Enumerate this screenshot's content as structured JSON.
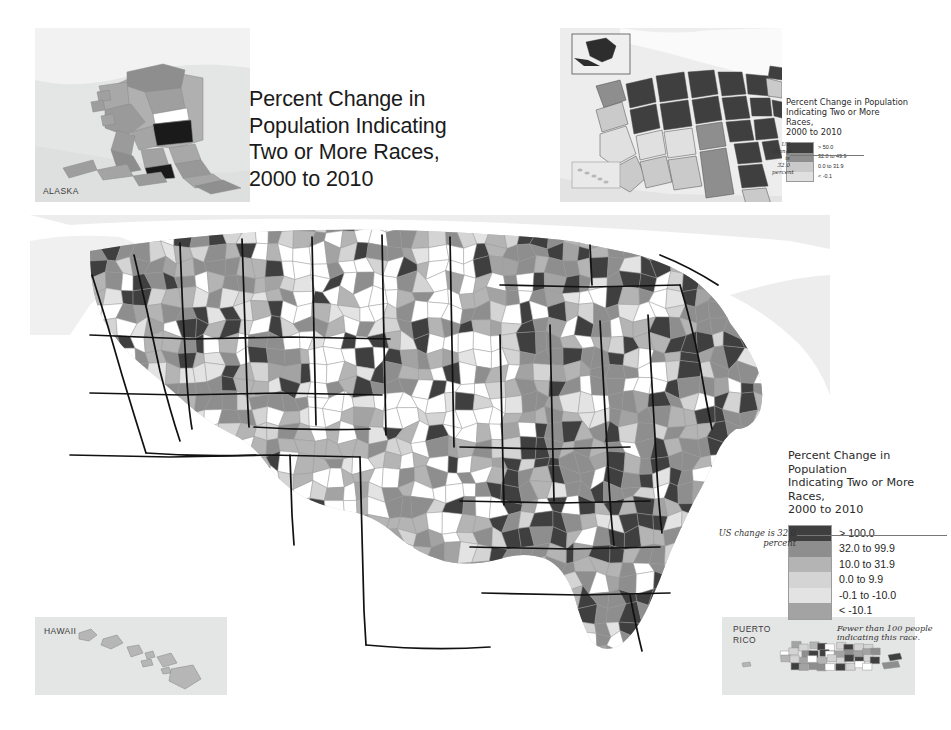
{
  "title": "Percent Change in\nPopulation Indicating\nTwo or More Races,\n2000 to 2010",
  "background_color": "#ffffff",
  "insets": {
    "alaska": {
      "label": "ALASKA",
      "panel_color": "#e4e5e5"
    },
    "hawaii": {
      "label": "HAWAII",
      "panel_color": "#e4e5e5"
    },
    "puerto_rico": {
      "label": "PUERTO\nRICO",
      "panel_color": "#e4e5e5"
    },
    "states": {
      "label": "",
      "panel_color": "#ededed"
    }
  },
  "main_legend": {
    "title": "Percent Change in Population\nIndicating Two or More\nRaces,\n2000 to 2010",
    "classes": [
      {
        "label": "> 100.0",
        "color": "#3f3f3f"
      },
      {
        "label": "32.0 to 99.9",
        "color": "#8e8e8e"
      },
      {
        "label": "10.0 to 31.9",
        "color": "#b4b4b4"
      },
      {
        "label": "0.0 to 9.9",
        "color": "#d4d4d4"
      },
      {
        "label": "-0.1 to -10.0",
        "color": "#e3e3e3"
      },
      {
        "label": "< -10.1",
        "color": "#a3a3a3"
      }
    ],
    "note": "Fewer than 100 people\nindicating this race.",
    "us_change_note": "US change is 32.0 percent"
  },
  "inset_legend": {
    "title": "Percent Change in Population\nIndicating Two or More\nRaces,\n2000 to 2010",
    "classes": [
      {
        "label": "> 50.0",
        "color": "#3f3f3f"
      },
      {
        "label": "32.0 to 49.9",
        "color": "#8e8e8e"
      },
      {
        "label": "0.0 to 31.9",
        "color": "#cacaca"
      },
      {
        "label": "< -0.1",
        "color": "#e0e0e0"
      }
    ],
    "us_change_note": "US\nchange\nis 32.0 percent"
  },
  "chart_data": {
    "type": "map",
    "map_kind": "choropleth",
    "title": "Percent Change in Population Indicating Two or More Races, 2000 to 2010",
    "geography_levels": [
      "county",
      "state"
    ],
    "variable": "Percent change in population indicating two or more races",
    "period": "2000 to 2010",
    "us_change_percent": 32.0,
    "county_classes": [
      {
        "label": "> 100.0",
        "color": "#3f3f3f",
        "min": 100.0,
        "max": null
      },
      {
        "label": "32.0 to 99.9",
        "color": "#8e8e8e",
        "min": 32.0,
        "max": 99.9
      },
      {
        "label": "10.0 to 31.9",
        "color": "#b4b4b4",
        "min": 10.0,
        "max": 31.9
      },
      {
        "label": "0.0 to 9.9",
        "color": "#d4d4d4",
        "min": 0.0,
        "max": 9.9
      },
      {
        "label": "-0.1 to -10.0",
        "color": "#e3e3e3",
        "min": -10.0,
        "max": -0.1
      },
      {
        "label": "< -10.1",
        "color": "#a3a3a3",
        "min": null,
        "max": -10.1
      },
      {
        "label": "Fewer than 100 people indicating this race.",
        "color": "#ffffff",
        "min": null,
        "max": null
      }
    ],
    "state_classes": [
      {
        "label": "> 50.0",
        "color": "#3f3f3f",
        "min": 50.0,
        "max": null
      },
      {
        "label": "32.0 to 49.9",
        "color": "#8e8e8e",
        "min": 32.0,
        "max": 49.9
      },
      {
        "label": "0.0 to 31.9",
        "color": "#cacaca",
        "min": 0.0,
        "max": 31.9
      },
      {
        "label": "< -0.1",
        "color": "#e0e0e0",
        "min": null,
        "max": -0.1
      }
    ],
    "regional_pattern": [
      {
        "region": "Southeast",
        "dominant_class": "> 100.0"
      },
      {
        "region": "Northeast",
        "dominant_class": "32.0 to 99.9"
      },
      {
        "region": "Great Plains",
        "dominant_class": "Fewer than 100 people indicating this race."
      },
      {
        "region": "Mountain West",
        "dominant_class": "10.0 to 31.9"
      },
      {
        "region": "West Coast",
        "dominant_class": "32.0 to 99.9"
      }
    ]
  },
  "map_seed": 20102000
}
